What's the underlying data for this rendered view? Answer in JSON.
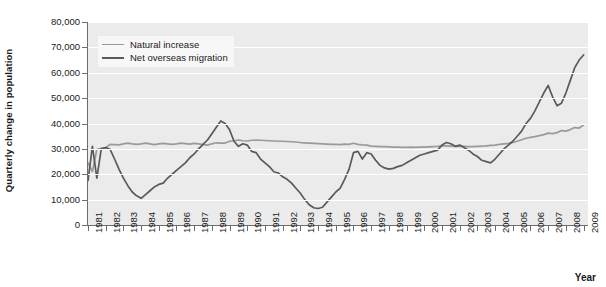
{
  "chart_data": {
    "type": "line",
    "title": "",
    "xlabel": "Year",
    "ylabel": "Quarterly change in population",
    "xlim": [
      1981,
      2009.25
    ],
    "ylim": [
      0,
      80000
    ],
    "ytick_labels": [
      "0",
      "10,000",
      "20,000",
      "30,000",
      "40,000",
      "50,000",
      "60,000",
      "70,000",
      "80,000"
    ],
    "ytick_values": [
      0,
      10000,
      20000,
      30000,
      40000,
      50000,
      60000,
      70000,
      80000
    ],
    "xtick_labels": [
      "1981",
      "1982",
      "1983",
      "1984",
      "1985",
      "1986",
      "1987",
      "1988",
      "1989",
      "1990",
      "1991",
      "1992",
      "1993",
      "1994",
      "1995",
      "1996",
      "1997",
      "1998",
      "1999",
      "2000",
      "2001",
      "2002",
      "2003",
      "2004",
      "2005",
      "2006",
      "2007",
      "2008",
      "2009"
    ],
    "grid": "horizontal",
    "legend_position": "upper-left",
    "colors": {
      "natural_increase": "#9a9a9a",
      "net_overseas_migration": "#5a5a5a",
      "plot_background": "#ebebeb",
      "gridline": "#ffffff",
      "axis": "#6e6e6e",
      "text": "#1a1a1a"
    },
    "series": [
      {
        "name": "Natural increase",
        "x": [
          1981.0,
          1981.25,
          1981.5,
          1981.75,
          1982.0,
          1982.25,
          1982.5,
          1982.75,
          1983.0,
          1983.25,
          1983.5,
          1983.75,
          1984.0,
          1984.25,
          1984.5,
          1984.75,
          1985.0,
          1985.25,
          1985.5,
          1985.75,
          1986.0,
          1986.25,
          1986.5,
          1986.75,
          1987.0,
          1987.25,
          1987.5,
          1987.75,
          1988.0,
          1988.25,
          1988.5,
          1988.75,
          1989.0,
          1989.25,
          1989.5,
          1989.75,
          1990.0,
          1990.25,
          1990.5,
          1990.75,
          1991.0,
          1991.25,
          1991.5,
          1991.75,
          1992.0,
          1992.25,
          1992.5,
          1992.75,
          1993.0,
          1993.25,
          1993.5,
          1993.75,
          1994.0,
          1994.25,
          1994.5,
          1994.75,
          1995.0,
          1995.25,
          1995.5,
          1995.75,
          1996.0,
          1996.25,
          1996.5,
          1996.75,
          1997.0,
          1997.25,
          1997.5,
          1997.75,
          1998.0,
          1998.25,
          1998.5,
          1998.75,
          1999.0,
          1999.25,
          1999.5,
          1999.75,
          2000.0,
          2000.25,
          2000.5,
          2000.75,
          2001.0,
          2001.25,
          2001.5,
          2001.75,
          2002.0,
          2002.25,
          2002.5,
          2002.75,
          2003.0,
          2003.25,
          2003.5,
          2003.75,
          2004.0,
          2004.25,
          2004.5,
          2004.75,
          2005.0,
          2005.25,
          2005.5,
          2005.75,
          2006.0,
          2006.25,
          2006.5,
          2006.75,
          2007.0,
          2007.25,
          2007.5,
          2007.75,
          2008.0,
          2008.25,
          2008.5,
          2008.75,
          2009.0
        ],
        "values": [
          24500,
          21000,
          29800,
          30200,
          30500,
          31800,
          31700,
          31600,
          32000,
          32300,
          32000,
          31800,
          32000,
          32300,
          32000,
          31700,
          32000,
          32200,
          32000,
          31800,
          32000,
          32300,
          32100,
          31900,
          32200,
          32000,
          31700,
          31500,
          32000,
          32400,
          32300,
          32300,
          33000,
          33200,
          33500,
          33200,
          33100,
          33400,
          33500,
          33400,
          33300,
          33200,
          33100,
          33000,
          33000,
          32900,
          32800,
          32700,
          32500,
          32400,
          32300,
          32200,
          32100,
          32000,
          31900,
          31800,
          31800,
          31700,
          31900,
          31800,
          32200,
          31800,
          31600,
          31500,
          31100,
          31000,
          30900,
          30900,
          30800,
          30700,
          30700,
          30600,
          30600,
          30700,
          30600,
          30700,
          30700,
          30800,
          30900,
          31000,
          31200,
          31200,
          31100,
          31000,
          31100,
          31000,
          30900,
          30900,
          31000,
          31100,
          31200,
          31400,
          31500,
          31800,
          32000,
          32200,
          32500,
          33000,
          33600,
          34200,
          34500,
          34800,
          35200,
          35600,
          36200,
          36000,
          36400,
          37200,
          37000,
          37600,
          38400,
          38200,
          39400
        ]
      },
      {
        "name": "Net overseas migration",
        "x": [
          1981.0,
          1981.25,
          1981.5,
          1981.75,
          1982.0,
          1982.25,
          1982.5,
          1982.75,
          1983.0,
          1983.25,
          1983.5,
          1983.75,
          1984.0,
          1984.25,
          1984.5,
          1984.75,
          1985.0,
          1985.25,
          1985.5,
          1985.75,
          1986.0,
          1986.25,
          1986.5,
          1986.75,
          1987.0,
          1987.25,
          1987.5,
          1987.75,
          1988.0,
          1988.25,
          1988.5,
          1988.75,
          1989.0,
          1989.25,
          1989.5,
          1989.75,
          1990.0,
          1990.25,
          1990.5,
          1990.75,
          1991.0,
          1991.25,
          1991.5,
          1991.75,
          1992.0,
          1992.25,
          1992.5,
          1992.75,
          1993.0,
          1993.25,
          1993.5,
          1993.75,
          1994.0,
          1994.25,
          1994.5,
          1994.75,
          1995.0,
          1995.25,
          1995.5,
          1995.75,
          1996.0,
          1996.25,
          1996.5,
          1996.75,
          1997.0,
          1997.25,
          1997.5,
          1997.75,
          1998.0,
          1998.25,
          1998.5,
          1998.75,
          1999.0,
          1999.25,
          1999.5,
          1999.75,
          2000.0,
          2000.25,
          2000.5,
          2000.75,
          2001.0,
          2001.25,
          2001.5,
          2001.75,
          2002.0,
          2002.25,
          2002.5,
          2002.75,
          2003.0,
          2003.25,
          2003.5,
          2003.75,
          2004.0,
          2004.25,
          2004.5,
          2004.75,
          2005.0,
          2005.25,
          2005.5,
          2005.75,
          2006.0,
          2006.25,
          2006.5,
          2006.75,
          2007.0,
          2007.25,
          2007.5,
          2007.75,
          2008.0,
          2008.25,
          2008.5,
          2008.75,
          2009.0
        ],
        "values": [
          17500,
          31000,
          18500,
          30000,
          30500,
          29800,
          26000,
          22000,
          18500,
          15500,
          13000,
          11500,
          10500,
          12000,
          13500,
          15000,
          16000,
          16500,
          18500,
          20000,
          21500,
          23000,
          24500,
          26500,
          28000,
          30000,
          31800,
          33500,
          36000,
          38500,
          41000,
          40000,
          37500,
          33000,
          31000,
          32000,
          31500,
          29000,
          28500,
          26000,
          24500,
          23000,
          21000,
          20500,
          19000,
          18000,
          16500,
          14500,
          12500,
          10000,
          8000,
          6800,
          6500,
          7000,
          9000,
          11000,
          13000,
          14500,
          18000,
          22000,
          28500,
          29000,
          26000,
          28500,
          28000,
          25500,
          23500,
          22500,
          22000,
          22300,
          23000,
          23500,
          24500,
          25500,
          26500,
          27500,
          28000,
          28500,
          29000,
          29500,
          31500,
          32500,
          32000,
          31000,
          31500,
          30500,
          29500,
          28000,
          27000,
          25500,
          25000,
          24500,
          26000,
          28000,
          30000,
          31500,
          33000,
          35000,
          37000,
          40000,
          42000,
          45000,
          48500,
          52000,
          55000,
          50500,
          47000,
          48000,
          52000,
          57000,
          62000,
          65000,
          67000
        ]
      }
    ]
  }
}
